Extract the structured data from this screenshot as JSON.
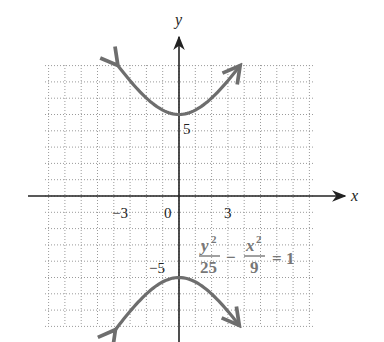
{
  "chart_data": {
    "type": "line",
    "title": "",
    "xlabel": "x",
    "ylabel": "y",
    "xlim": [
      -8.2,
      8.3
    ],
    "ylim": [
      -8,
      8
    ],
    "grid": true,
    "grid_style": "dotted",
    "x_ticks": [
      {
        "value": -3,
        "label": "−3"
      },
      {
        "value": 0,
        "label": "0"
      },
      {
        "value": 3,
        "label": "3"
      }
    ],
    "y_ticks": [
      {
        "value": 5,
        "label": "5"
      },
      {
        "value": -5,
        "label": "−5"
      }
    ],
    "series": [
      {
        "name": "upper branch",
        "equation": "y = 5*sqrt(1 + x^2/9)",
        "x_range": [
          -3.75,
          3.75
        ],
        "vertex": [
          0,
          5
        ],
        "color": "#6e6e6e"
      },
      {
        "name": "lower branch",
        "equation": "y = -5*sqrt(1 + x^2/9)",
        "x_range": [
          -3.9,
          3.7
        ],
        "vertex": [
          0,
          -5
        ],
        "color": "#6e6e6e"
      }
    ],
    "annotations": [
      {
        "text": "y^2/25 - x^2/9 = 1",
        "position": [
          1.2,
          -3.2
        ],
        "parts": {
          "num1": "y",
          "sup1": "2",
          "den1": "25",
          "minus": "−",
          "num2": "x",
          "sup2": "2",
          "den2": "9",
          "equals": "= 1"
        }
      }
    ]
  },
  "labels": {
    "x_axis": "x",
    "y_axis": "y",
    "tick_neg3": "−3",
    "tick_0": "0",
    "tick_3": "3",
    "tick_5": "5",
    "tick_neg5": "−5",
    "eq_num1": "y",
    "eq_sup1": "2",
    "eq_den1": "25",
    "eq_minus": "−",
    "eq_num2": "x",
    "eq_sup2": "2",
    "eq_den2": "9",
    "eq_equals": "= 1"
  },
  "colors": {
    "curve": "#6e6e6e",
    "axis": "#222222",
    "grid": "#9a9a9a",
    "equation": "#777777"
  }
}
